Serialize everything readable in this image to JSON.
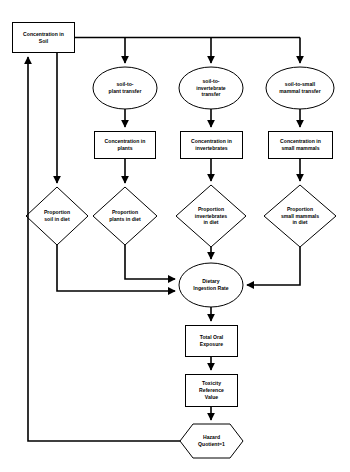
{
  "diagram": {
    "type": "flowchart",
    "background_color": "#ffffff",
    "line_color": "#000000",
    "shape_fill": "#ffffff",
    "text_color": "#000000",
    "nodes": {
      "concentration_soil": "Concentration in\nSoil",
      "soil_to_plant": "soil-to-\nplant transfer",
      "soil_to_invertebrate": "soil-to-\ninvertebrate\ntransfer",
      "soil_to_small_mammal": "soil-to-small\nmammal transfer",
      "concentration_plants": "Concentration in\nplants",
      "concentration_invertebrates": "Concentration in\ninvertebrates",
      "concentration_small_mammals": "Concentration in\nsmall mammals",
      "proportion_soil": "Proportion\nsoil in diet",
      "proportion_plants": "Proportion\nplants in diet",
      "proportion_invertebrates": "Proportion\ninvertebrates\nin diet",
      "proportion_small_mammals": "Proportion\nsmall mammals\nin diet",
      "dietary_ingestion_rate": "Dietary\nIngestion Rate",
      "total_oral_exposure": "Total Oral\nExposure",
      "toxicity_reference_value": "Toxicity\nReference\nValue",
      "hazard_quotient": "Hazard\nQuotient=1"
    },
    "shapes": {
      "concentration_soil": "rectangle",
      "soil_to_plant": "ellipse",
      "soil_to_invertebrate": "ellipse",
      "soil_to_small_mammal": "ellipse",
      "concentration_plants": "rectangle",
      "concentration_invertebrates": "rectangle",
      "concentration_small_mammals": "rectangle",
      "proportion_soil": "diamond",
      "proportion_plants": "diamond",
      "proportion_invertebrates": "diamond",
      "proportion_small_mammals": "diamond",
      "dietary_ingestion_rate": "ellipse",
      "total_oral_exposure": "rectangle",
      "toxicity_reference_value": "rectangle",
      "hazard_quotient": "hexagon"
    }
  }
}
